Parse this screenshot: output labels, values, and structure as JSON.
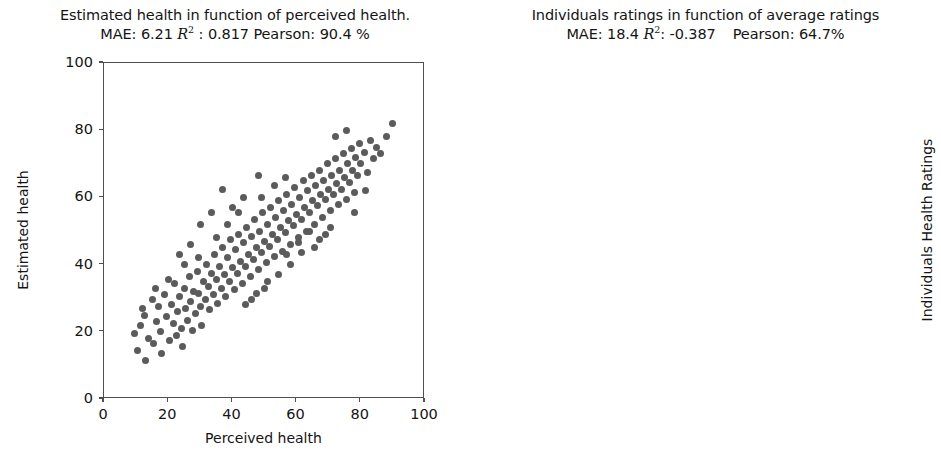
{
  "figure": {
    "width": 941,
    "height": 458,
    "background": "#ffffff",
    "point_color": "#5b5b5b",
    "axis_color": "#4f4f4f",
    "text_color": "#141414"
  },
  "chart_data": [
    {
      "type": "scatter",
      "panel": "left",
      "title": "Estimated health in function of perceived health.",
      "subtitle_parts": {
        "mae_label": "MAE:",
        "mae_value": "6.21",
        "r2_symbol": "R",
        "r2_sup": "2",
        "r2_sep": ":",
        "r2_value": "0.817",
        "pearson_label": "Pearson:",
        "pearson_value": "90.4 %"
      },
      "subtitle": "MAE: 6.21 R2 : 0.817 Pearson: 90.4 %",
      "metrics": {
        "MAE": 6.21,
        "R2": 0.817,
        "Pearson": "90.4 %"
      },
      "xlabel": "Perceived health",
      "ylabel": "Estimated health",
      "xlim": [
        0,
        100
      ],
      "ylim": [
        0,
        100
      ],
      "xticks": [
        0,
        20,
        40,
        60,
        80,
        100
      ],
      "yticks": [
        0,
        20,
        40,
        60,
        80,
        100
      ],
      "grid": false,
      "legend": null,
      "marker_size": 7,
      "points": [
        [
          9.5,
          19.5
        ],
        [
          10.5,
          14.5
        ],
        [
          11.5,
          22.0
        ],
        [
          12.5,
          25.0
        ],
        [
          13.0,
          11.5
        ],
        [
          14.0,
          18.0
        ],
        [
          15.0,
          29.5
        ],
        [
          15.5,
          16.5
        ],
        [
          16.5,
          23.0
        ],
        [
          17.0,
          27.5
        ],
        [
          17.5,
          20.0
        ],
        [
          18.0,
          13.5
        ],
        [
          19.0,
          31.0
        ],
        [
          19.5,
          24.5
        ],
        [
          20.5,
          17.5
        ],
        [
          21.0,
          28.0
        ],
        [
          21.5,
          22.5
        ],
        [
          22.0,
          34.5
        ],
        [
          22.5,
          19.0
        ],
        [
          23.0,
          26.0
        ],
        [
          23.5,
          30.5
        ],
        [
          24.0,
          21.0
        ],
        [
          24.5,
          15.5
        ],
        [
          25.0,
          33.0
        ],
        [
          25.5,
          27.0
        ],
        [
          26.0,
          23.5
        ],
        [
          26.5,
          36.5
        ],
        [
          27.0,
          29.0
        ],
        [
          27.5,
          20.5
        ],
        [
          28.0,
          32.0
        ],
        [
          28.5,
          25.5
        ],
        [
          29.0,
          38.0
        ],
        [
          29.5,
          31.5
        ],
        [
          30.0,
          27.5
        ],
        [
          30.5,
          22.0
        ],
        [
          31.0,
          35.0
        ],
        [
          31.5,
          29.5
        ],
        [
          32.0,
          40.0
        ],
        [
          32.5,
          33.5
        ],
        [
          33.0,
          26.5
        ],
        [
          33.5,
          37.5
        ],
        [
          34.0,
          31.0
        ],
        [
          34.5,
          43.0
        ],
        [
          35.0,
          35.5
        ],
        [
          35.5,
          28.5
        ],
        [
          36.0,
          39.5
        ],
        [
          36.5,
          33.0
        ],
        [
          37.0,
          45.0
        ],
        [
          37.5,
          37.0
        ],
        [
          38.0,
          30.5
        ],
        [
          38.5,
          42.0
        ],
        [
          39.0,
          35.0
        ],
        [
          39.5,
          47.5
        ],
        [
          40.0,
          39.0
        ],
        [
          40.5,
          32.5
        ],
        [
          41.0,
          44.5
        ],
        [
          41.5,
          37.5
        ],
        [
          42.0,
          49.0
        ],
        [
          42.5,
          41.0
        ],
        [
          43.0,
          34.5
        ],
        [
          43.5,
          46.5
        ],
        [
          44.0,
          39.5
        ],
        [
          44.5,
          51.0
        ],
        [
          45.0,
          43.0
        ],
        [
          45.5,
          36.5
        ],
        [
          46.0,
          48.5
        ],
        [
          46.5,
          41.5
        ],
        [
          47.0,
          53.5
        ],
        [
          47.5,
          45.0
        ],
        [
          48.0,
          38.5
        ],
        [
          48.5,
          50.0
        ],
        [
          49.0,
          43.5
        ],
        [
          49.5,
          55.5
        ],
        [
          50.0,
          47.0
        ],
        [
          50.5,
          40.5
        ],
        [
          51.0,
          52.0
        ],
        [
          51.5,
          45.5
        ],
        [
          52.0,
          57.0
        ],
        [
          52.5,
          49.0
        ],
        [
          53.0,
          42.5
        ],
        [
          53.5,
          54.0
        ],
        [
          54.0,
          47.5
        ],
        [
          54.5,
          59.0
        ],
        [
          55.0,
          51.0
        ],
        [
          55.5,
          44.0
        ],
        [
          56.0,
          56.0
        ],
        [
          56.5,
          49.5
        ],
        [
          57.0,
          61.0
        ],
        [
          57.5,
          53.0
        ],
        [
          58.0,
          46.0
        ],
        [
          58.5,
          58.0
        ],
        [
          59.0,
          51.5
        ],
        [
          59.5,
          63.0
        ],
        [
          60.0,
          55.0
        ],
        [
          60.5,
          48.0
        ],
        [
          61.0,
          60.0
        ],
        [
          61.5,
          53.5
        ],
        [
          62.0,
          65.0
        ],
        [
          62.5,
          57.0
        ],
        [
          63.0,
          50.0
        ],
        [
          63.5,
          62.0
        ],
        [
          64.0,
          55.5
        ],
        [
          64.5,
          66.5
        ],
        [
          65.0,
          59.0
        ],
        [
          65.5,
          52.0
        ],
        [
          66.0,
          63.5
        ],
        [
          66.5,
          57.5
        ],
        [
          67.0,
          68.0
        ],
        [
          67.5,
          61.0
        ],
        [
          68.0,
          54.0
        ],
        [
          68.5,
          65.0
        ],
        [
          69.0,
          59.5
        ],
        [
          69.5,
          70.0
        ],
        [
          70.0,
          62.5
        ],
        [
          70.5,
          56.0
        ],
        [
          71.0,
          66.5
        ],
        [
          71.5,
          61.0
        ],
        [
          72.0,
          71.5
        ],
        [
          72.5,
          64.0
        ],
        [
          73.0,
          58.0
        ],
        [
          73.5,
          68.0
        ],
        [
          74.0,
          62.5
        ],
        [
          74.5,
          73.0
        ],
        [
          75.0,
          66.0
        ],
        [
          75.5,
          59.5
        ],
        [
          76.0,
          70.0
        ],
        [
          76.5,
          64.5
        ],
        [
          77.0,
          74.5
        ],
        [
          77.5,
          68.0
        ],
        [
          78.0,
          61.5
        ],
        [
          78.5,
          72.0
        ],
        [
          79.0,
          66.5
        ],
        [
          79.5,
          76.0
        ],
        [
          80.0,
          70.0
        ],
        [
          81.0,
          73.5
        ],
        [
          82.0,
          67.5
        ],
        [
          83.0,
          77.0
        ],
        [
          84.0,
          71.5
        ],
        [
          85.0,
          75.0
        ],
        [
          86.0,
          73.0
        ],
        [
          88.0,
          78.0
        ],
        [
          90.0,
          82.0
        ],
        [
          44.0,
          28.0
        ],
        [
          47.5,
          31.5
        ],
        [
          51.0,
          35.0
        ],
        [
          35.0,
          48.0
        ],
        [
          38.5,
          52.0
        ],
        [
          42.0,
          55.5
        ],
        [
          29.5,
          42.0
        ],
        [
          57.0,
          43.0
        ],
        [
          60.5,
          46.5
        ],
        [
          64.0,
          50.0
        ],
        [
          67.0,
          47.5
        ],
        [
          70.5,
          51.0
        ],
        [
          25.0,
          40.0
        ],
        [
          20.0,
          35.5
        ],
        [
          16.0,
          33.0
        ],
        [
          12.0,
          27.0
        ],
        [
          33.5,
          55.5
        ],
        [
          30.0,
          52.0
        ],
        [
          49.0,
          60.0
        ],
        [
          53.0,
          63.5
        ],
        [
          56.5,
          66.0
        ],
        [
          72.0,
          78.0
        ],
        [
          75.5,
          80.0
        ],
        [
          78.0,
          55.5
        ],
        [
          81.5,
          62.0
        ],
        [
          46.0,
          29.5
        ],
        [
          50.0,
          33.0
        ],
        [
          54.5,
          37.0
        ],
        [
          58.0,
          40.0
        ],
        [
          61.5,
          43.5
        ],
        [
          65.5,
          45.0
        ],
        [
          69.0,
          49.0
        ],
        [
          27.0,
          46.0
        ],
        [
          23.5,
          43.0
        ],
        [
          40.0,
          57.0
        ],
        [
          43.5,
          60.0
        ],
        [
          37.0,
          62.5
        ],
        [
          48.0,
          66.5
        ]
      ]
    },
    {
      "type": "scatter",
      "panel": "right",
      "title": "Individuals ratings in function of average ratings",
      "subtitle_parts": {
        "mae_label": "MAE:",
        "mae_value": "18.4",
        "r2_symbol": "R",
        "r2_sup": "2",
        "r2_sep": ":",
        "r2_value": "-0.387",
        "pearson_label": "Pearson:",
        "pearson_value": "64.7%"
      },
      "subtitle": "MAE: 18.4 R2: -0.387   Pearson: 64.7%",
      "metrics": {
        "MAE": 18.4,
        "R2": -0.387,
        "Pearson": "64.7%"
      },
      "xlabel": "Average Health Ratings",
      "ylabel": "Individuals Health Ratings",
      "xlim": [
        0,
        100
      ],
      "ylim": [
        0,
        100
      ],
      "xticks": [
        0,
        20,
        40,
        60,
        80,
        100
      ],
      "yticks": [
        0,
        20,
        40,
        60,
        80,
        100
      ],
      "grid": false,
      "legend": null,
      "marker_size": 6,
      "description": "Very dense scatter forming vertical bands at discrete average-rating values; density highest between x=25 and x=70, spanning the full y range 0-100, sparse above x=85.",
      "density_bands": [
        {
          "x": 7,
          "weight": 0.3,
          "ymin": 0,
          "ymax": 88
        },
        {
          "x": 9,
          "weight": 0.28,
          "ymin": 0,
          "ymax": 65
        },
        {
          "x": 11,
          "weight": 0.36,
          "ymin": 0,
          "ymax": 70
        },
        {
          "x": 13,
          "weight": 0.4,
          "ymin": 0,
          "ymax": 80
        },
        {
          "x": 15,
          "weight": 0.42,
          "ymin": 0,
          "ymax": 85
        },
        {
          "x": 17,
          "weight": 0.46,
          "ymin": 0,
          "ymax": 92
        },
        {
          "x": 19,
          "weight": 0.52,
          "ymin": 0,
          "ymax": 96
        },
        {
          "x": 21,
          "weight": 0.62,
          "ymin": 0,
          "ymax": 100
        },
        {
          "x": 23,
          "weight": 0.58,
          "ymin": 0,
          "ymax": 100
        },
        {
          "x": 25,
          "weight": 0.7,
          "ymin": 0,
          "ymax": 100
        },
        {
          "x": 27,
          "weight": 0.66,
          "ymin": 0,
          "ymax": 100
        },
        {
          "x": 29,
          "weight": 0.74,
          "ymin": 0,
          "ymax": 100
        },
        {
          "x": 31,
          "weight": 0.8,
          "ymin": 0,
          "ymax": 100
        },
        {
          "x": 33,
          "weight": 0.86,
          "ymin": 0,
          "ymax": 100
        },
        {
          "x": 35,
          "weight": 0.78,
          "ymin": 0,
          "ymax": 100
        },
        {
          "x": 37,
          "weight": 0.84,
          "ymin": 0,
          "ymax": 100
        },
        {
          "x": 39,
          "weight": 0.9,
          "ymin": 0,
          "ymax": 100
        },
        {
          "x": 41,
          "weight": 0.88,
          "ymin": 0,
          "ymax": 100
        },
        {
          "x": 43,
          "weight": 0.94,
          "ymin": 0,
          "ymax": 100
        },
        {
          "x": 45,
          "weight": 0.92,
          "ymin": 0,
          "ymax": 100
        },
        {
          "x": 47,
          "weight": 0.96,
          "ymin": 0,
          "ymax": 100
        },
        {
          "x": 49,
          "weight": 0.9,
          "ymin": 0,
          "ymax": 100
        },
        {
          "x": 51,
          "weight": 0.94,
          "ymin": 0,
          "ymax": 100
        },
        {
          "x": 53,
          "weight": 0.88,
          "ymin": 0,
          "ymax": 100
        },
        {
          "x": 55,
          "weight": 0.96,
          "ymin": 0,
          "ymax": 100
        },
        {
          "x": 57,
          "weight": 0.82,
          "ymin": 0,
          "ymax": 100
        },
        {
          "x": 59,
          "weight": 0.86,
          "ymin": 0,
          "ymax": 100
        },
        {
          "x": 61,
          "weight": 0.8,
          "ymin": 0,
          "ymax": 100
        },
        {
          "x": 63,
          "weight": 0.84,
          "ymin": 0,
          "ymax": 100
        },
        {
          "x": 65,
          "weight": 0.76,
          "ymin": 0,
          "ymax": 100
        },
        {
          "x": 67,
          "weight": 0.8,
          "ymin": 0,
          "ymax": 100
        },
        {
          "x": 69,
          "weight": 0.72,
          "ymin": 0,
          "ymax": 100
        },
        {
          "x": 71,
          "weight": 0.68,
          "ymin": 0,
          "ymax": 100
        },
        {
          "x": 73,
          "weight": 0.6,
          "ymin": 0,
          "ymax": 100
        },
        {
          "x": 75,
          "weight": 0.64,
          "ymin": 0,
          "ymax": 100
        },
        {
          "x": 77,
          "weight": 0.5,
          "ymin": 0,
          "ymax": 100
        },
        {
          "x": 79,
          "weight": 0.46,
          "ymin": 0,
          "ymax": 100
        },
        {
          "x": 81,
          "weight": 0.34,
          "ymin": 0,
          "ymax": 100
        },
        {
          "x": 83,
          "weight": 0.26,
          "ymin": 0,
          "ymax": 100
        },
        {
          "x": 85,
          "weight": 0.16,
          "ymin": 0,
          "ymax": 100
        },
        {
          "x": 87,
          "weight": 0.1,
          "ymin": 0,
          "ymax": 98
        },
        {
          "x": 89,
          "weight": 0.06,
          "ymin": 0,
          "ymax": 96
        },
        {
          "x": 91,
          "weight": 0.04,
          "ymin": 0,
          "ymax": 92
        }
      ]
    }
  ]
}
